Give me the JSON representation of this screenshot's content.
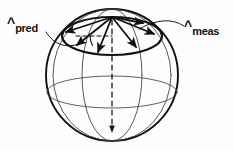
{
  "figure": {
    "kind": "line-diagram",
    "background_color": "#fdfdfd",
    "ink_color": "#111111",
    "caption_labels": {
      "pred": {
        "hat": "^",
        "subscript": "pred"
      },
      "meas": {
        "hat": "^",
        "subscript": "meas"
      }
    }
  },
  "diagram_data": {
    "type": "geometry-line-art",
    "subject": "unit sphere with predicted and measured unit-vector cone",
    "canvas": {
      "width": 234,
      "height": 151
    },
    "sphere": {
      "center_x": 112,
      "center_y": 75,
      "radius": 66,
      "stroke_width": 1.9,
      "stroke": "#111111",
      "fill": "none"
    },
    "equator": {
      "name": "equator-ellipse",
      "center_x": 112,
      "center_y": 92,
      "rx": 65.2,
      "ry": 16,
      "stroke_width": 0.9
    },
    "meridians": [
      {
        "name": "meridian-left",
        "center_x": 112,
        "center_y": 75,
        "rx": 30,
        "ry": 66,
        "stroke_width": 0.9
      },
      {
        "name": "meridian-right",
        "center_x": 112,
        "center_y": 75,
        "rx": 59,
        "ry": 66,
        "stroke_width": 0.9
      }
    ],
    "cone_rim": {
      "name": "cone-base-ellipse",
      "center_x": 112,
      "center_y": 36,
      "rx": 50,
      "ry": 19,
      "stroke_width": 2.1
    },
    "apex": {
      "x": 112,
      "y": 17
    },
    "radial_arrows": [
      {
        "name": "arrow-west",
        "x2": 63,
        "y2": 33,
        "label_ref": "pred"
      },
      {
        "name": "arrow-southwest",
        "x2": 75,
        "y2": 46
      },
      {
        "name": "arrow-south",
        "x2": 97,
        "y2": 53
      },
      {
        "name": "arrow-southeast",
        "x2": 137,
        "y2": 48
      },
      {
        "name": "arrow-east",
        "x2": 156,
        "y2": 34
      },
      {
        "name": "arrow-northeast",
        "x2": 144,
        "y2": 23,
        "label_ref": "meas"
      }
    ],
    "dashed_horizontal": {
      "name": "dashed-radius-line",
      "x1": 78,
      "y1": 36,
      "x2": 112,
      "y2": 36,
      "dash": "4 3"
    },
    "dashed_axis": {
      "name": "dashed-polar-axis",
      "x1": 112,
      "y1": 20,
      "x2": 112,
      "y2": 131,
      "dash": "5 4",
      "arrowhead_at": {
        "x": 112,
        "y": 131
      }
    },
    "angle_arc": {
      "name": "cone-half-angle-arc",
      "center_x": 112,
      "center_y": 36,
      "radius": 22,
      "start_deg": 180,
      "end_deg": 208
    },
    "leader_lines": [
      {
        "name": "leader-pred",
        "from": {
          "x": 46,
          "y": 33
        },
        "ctrl": {
          "x": 56,
          "y": 52
        },
        "to": {
          "x": 76,
          "y": 44
        }
      },
      {
        "name": "leader-meas",
        "from": {
          "x": 183,
          "y": 27
        },
        "ctrl": {
          "x": 166,
          "y": 17
        },
        "to": {
          "x": 140,
          "y": 30
        }
      }
    ]
  }
}
